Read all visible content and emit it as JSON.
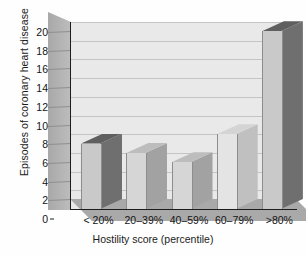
{
  "chart_data": {
    "type": "bar",
    "title": "",
    "xlabel": "Hostility score (percentile)",
    "ylabel": "Episodes of coronary heart disease",
    "categories": [
      "< 20%",
      "20–39%",
      "40–59%",
      "60–79%",
      ">80%"
    ],
    "values": [
      7,
      6,
      5,
      8,
      19
    ],
    "ylim": [
      0,
      20
    ],
    "ytick_step": 2,
    "yticks": [
      "0",
      "2",
      "4",
      "6",
      "8",
      "10",
      "12",
      "14",
      "16",
      "18",
      "20"
    ],
    "grid": true,
    "legend": "none",
    "style": "3d-columns",
    "series": [
      {
        "name": "Episodes of coronary heart disease",
        "values": [
          7,
          6,
          5,
          8,
          19
        ]
      }
    ],
    "bar_styles": [
      {
        "category": "< 20%",
        "value": 7,
        "front": "#c9c9c9",
        "side": "#6f6f6f",
        "top": "#5f5f5f"
      },
      {
        "category": "20–39%",
        "value": 6,
        "front": "#d6d6d6",
        "side": "#a2a2a2",
        "top": "#bdbdbd"
      },
      {
        "category": "40–59%",
        "value": 5,
        "front": "#d6d6d6",
        "side": "#a2a2a2",
        "top": "#bdbdbd"
      },
      {
        "category": "60–79%",
        "value": 8,
        "front": "#e4e4e4",
        "side": "#c0c0c0",
        "top": "#d4d4d4"
      },
      {
        "category": ">80%",
        "value": 19,
        "front": "#c9c9c9",
        "side": "#6f6f6f",
        "top": "#5f5f5f"
      }
    ]
  },
  "colors": {
    "plot_background": "#e9e9e9",
    "gridline": "#c4c4c4",
    "wall": "#b0b0b0",
    "floor": "#a9a9a9",
    "axis": "#1d1d1d",
    "text": "#141414",
    "page_background": "#ffffff"
  },
  "axis": {
    "y_title": "Episodes of coronary heart disease",
    "x_title": "Hostility score (percentile)"
  }
}
